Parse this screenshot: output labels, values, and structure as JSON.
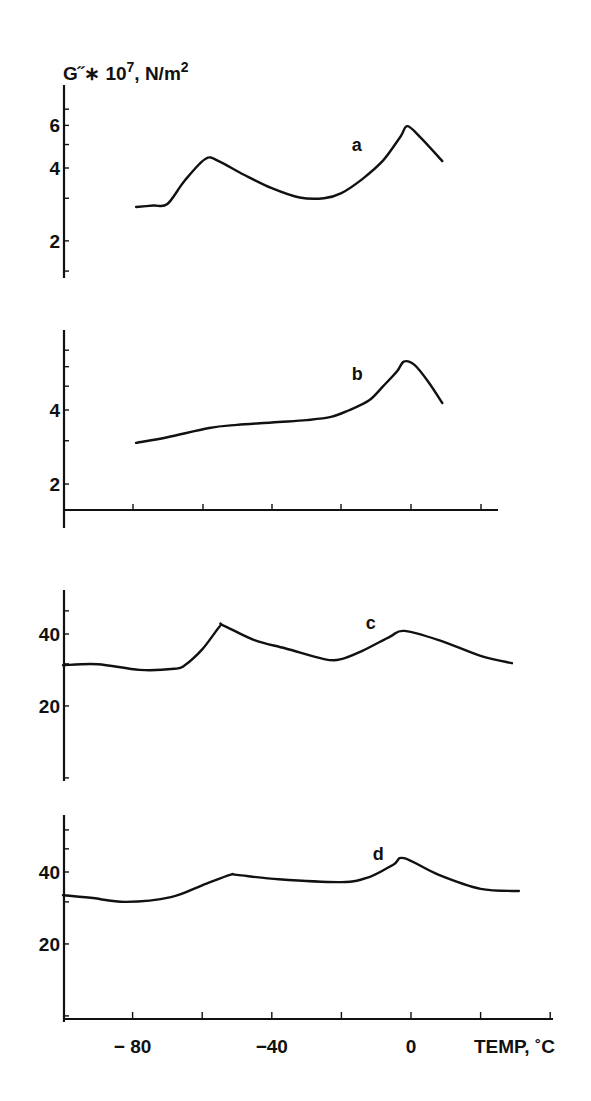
{
  "figure": {
    "ylabel_main": "G˝∗ 10",
    "ylabel_exp": "7",
    "ylabel_unit": ", N/m",
    "ylabel_unit_exp": "2",
    "xlabel": "TEMP, ˚C",
    "x_tick_labels": [
      {
        "value": -80,
        "label": "− 80"
      },
      {
        "value": -40,
        "label": "−40"
      },
      {
        "value": 0,
        "label": "0"
      }
    ]
  },
  "chart_data": [
    {
      "type": "line",
      "panel": "a",
      "title": "",
      "xlabel": "TEMP, ˚C",
      "ylabel": "G\" * 10^7, N/m^2",
      "yscale": "log",
      "yticks": [
        2,
        4,
        6
      ],
      "xlim": [
        -100,
        40
      ],
      "ylim": [
        1.2,
        7.5
      ],
      "series": [
        {
          "name": "a",
          "x": [
            -79,
            -74,
            -70,
            -65,
            -59,
            -55,
            -48,
            -40,
            -32,
            -25,
            -20,
            -14,
            -8,
            -3,
            -1,
            3,
            9
          ],
          "y": [
            2.76,
            2.8,
            2.84,
            3.55,
            4.37,
            4.25,
            3.75,
            3.3,
            3.02,
            3.0,
            3.15,
            3.6,
            4.3,
            5.4,
            5.96,
            5.3,
            4.27
          ]
        }
      ],
      "label_annotation": {
        "text": "a",
        "x": -17,
        "y": 4.7
      }
    },
    {
      "type": "line",
      "panel": "b",
      "title": "",
      "xlabel": "TEMP, ˚C",
      "ylabel": "G\" * 10^7, N/m^2",
      "yscale": "log",
      "yticks": [
        2,
        4
      ],
      "xlim": [
        -100,
        40
      ],
      "ylim": [
        1.5,
        7.0
      ],
      "series": [
        {
          "name": "b",
          "x": [
            -79,
            -70,
            -58,
            -50,
            -40,
            -30,
            -23,
            -18,
            -12,
            -8,
            -4,
            -2,
            1,
            5,
            9
          ],
          "y": [
            2.94,
            3.1,
            3.38,
            3.48,
            3.56,
            3.64,
            3.75,
            3.98,
            4.38,
            5.0,
            5.75,
            6.3,
            6.1,
            5.2,
            4.27
          ]
        }
      ],
      "label_annotation": {
        "text": "b",
        "x": -17,
        "y": 5.3
      }
    },
    {
      "type": "line",
      "panel": "c",
      "title": "",
      "xlabel": "TEMP, ˚C",
      "ylabel": "G\" * 10^7, N/m^2",
      "yscale": "log",
      "yticks": [
        20,
        40
      ],
      "xlim": [
        -100,
        40
      ],
      "ylim": [
        10,
        55
      ],
      "series": [
        {
          "name": "c",
          "x": [
            -100,
            -90,
            -78,
            -68,
            -65,
            -60,
            -55,
            -54,
            -45,
            -36,
            -25,
            -20,
            -14,
            -6,
            -2,
            8,
            20,
            29
          ],
          "y": [
            29.6,
            29.9,
            28.3,
            28.6,
            29.6,
            34.5,
            43.0,
            43.5,
            37.7,
            34.8,
            31.4,
            31.4,
            34.0,
            39.0,
            41.2,
            37.7,
            32.4,
            30.2
          ]
        }
      ],
      "label_annotation": {
        "text": "c",
        "x": -13,
        "y": 42
      }
    },
    {
      "type": "line",
      "panel": "d",
      "title": "",
      "xlabel": "TEMP, ˚C",
      "ylabel": "G\" * 10^7, N/m^2",
      "yscale": "log",
      "yticks": [
        20,
        40
      ],
      "xticks": [
        -80,
        -40,
        0
      ],
      "xlim": [
        -100,
        40
      ],
      "ylim": [
        10,
        60
      ],
      "series": [
        {
          "name": "d",
          "x": [
            -100,
            -92,
            -82,
            -69,
            -60,
            -52,
            -50,
            -38,
            -20,
            -12,
            -5,
            -2,
            8,
            20,
            31
          ],
          "y": [
            32.0,
            31.2,
            30.0,
            31.4,
            35.2,
            38.9,
            38.9,
            37.3,
            36.3,
            38.1,
            43.0,
            45.7,
            38.9,
            34.0,
            33.3
          ]
        }
      ],
      "label_annotation": {
        "text": "d",
        "x": -11,
        "y": 45
      }
    }
  ]
}
